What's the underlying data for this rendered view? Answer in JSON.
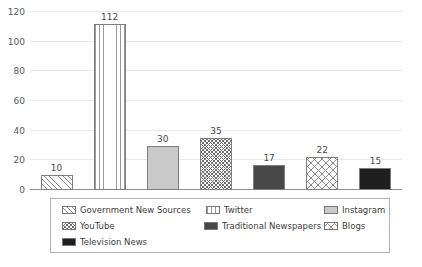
{
  "chart_data": {
    "type": "bar",
    "title": "",
    "xlabel": "",
    "ylabel": "",
    "ylim": [
      0,
      120
    ],
    "grid": true,
    "legend_position": "bottom",
    "categories": [
      "Government New Sources",
      "Twitter",
      "Instagram",
      "YouTube",
      "Traditional Newspapers",
      "Blogs",
      "Television News"
    ],
    "values": [
      10,
      112,
      30,
      35,
      17,
      22,
      15
    ],
    "value_labels": [
      "10",
      "112",
      "30",
      "35",
      "17",
      "22",
      "15"
    ],
    "yticks": [
      0,
      20,
      40,
      60,
      80,
      100,
      120
    ],
    "ytick_labels": [
      "0",
      "20",
      "40",
      "60",
      "80",
      "100",
      "120"
    ],
    "series": [
      {
        "name": "News Source Mentions",
        "values": [
          10,
          112,
          30,
          35,
          17,
          22,
          15
        ]
      }
    ],
    "bar_fills": [
      "diagonal-hatch",
      "vertical-lines",
      "solid-light-gray",
      "dense-crosshatch",
      "solid-dark-gray",
      "wide-crosshatch",
      "solid-black"
    ]
  },
  "axis": {
    "ytick_labels": [
      "120",
      "100",
      "80",
      "60",
      "40",
      "20",
      "0"
    ]
  },
  "bars": [
    {
      "label": "Government New Sources",
      "value": 10,
      "value_label": "10",
      "fill": "fill-diag-light"
    },
    {
      "label": "Twitter",
      "value": 112,
      "value_label": "112",
      "fill": "fill-vlines"
    },
    {
      "label": "Instagram",
      "value": 30,
      "value_label": "30",
      "fill": "fill-solid-light"
    },
    {
      "label": "YouTube",
      "value": 35,
      "value_label": "35",
      "fill": "fill-crosshatch-dense"
    },
    {
      "label": "Traditional Newspapers",
      "value": 17,
      "value_label": "17",
      "fill": "fill-solid-dark"
    },
    {
      "label": "Blogs",
      "value": 22,
      "value_label": "22",
      "fill": "fill-crosshatch-wide"
    },
    {
      "label": "Television News",
      "value": 15,
      "value_label": "15",
      "fill": "fill-solid-black"
    }
  ],
  "legend": {
    "items": [
      {
        "label": "Government New Sources",
        "fill": "fill-diag-light"
      },
      {
        "label": "Twitter",
        "fill": "fill-vlines"
      },
      {
        "label": "Instagram",
        "fill": "fill-solid-light"
      },
      {
        "label": "YouTube",
        "fill": "fill-crosshatch-dense"
      },
      {
        "label": "Traditional Newspapers",
        "fill": "fill-solid-dark"
      },
      {
        "label": "Blogs",
        "fill": "fill-crosshatch-wide"
      },
      {
        "label": "Television News",
        "fill": "fill-solid-black"
      }
    ]
  },
  "colors": {
    "gridline": "#e8e8e8",
    "axis": "#8f8f8f",
    "bar_outline": "#7d7d7d",
    "text": "#58595b",
    "legend_border": "#b0b0b0",
    "solid_light": "#c9c9c9",
    "solid_dark": "#484848",
    "solid_black": "#1f1f1f"
  }
}
